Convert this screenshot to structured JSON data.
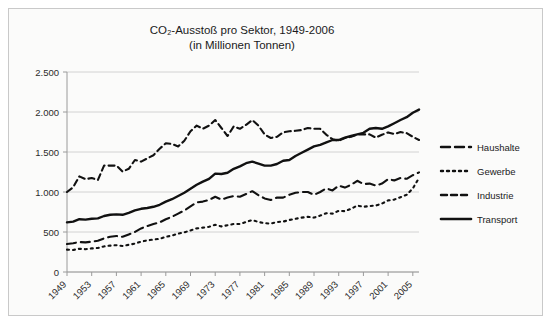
{
  "figure": {
    "title_line1": "CO₂-Ausstoß pro Sektor, 1949-2006",
    "title_line2": "(in Millionen Tonnen)",
    "background": "#fbfbfa",
    "border_color": "#c9c9c9",
    "ink_color": "#111111",
    "grid_color": "#d2d2d2"
  },
  "chart_data": {
    "type": "line",
    "title": "CO₂-Ausstoß pro Sektor, 1949-2006 (in Millionen Tonnen)",
    "subtitle": "(in Millionen Tonnen)",
    "xlabel": "",
    "ylabel": "",
    "ylim": [
      0,
      2500
    ],
    "yticks": [
      0,
      500,
      1000,
      1500,
      2000,
      2500
    ],
    "ytick_labels": [
      "0",
      "500",
      "1.000",
      "1.500",
      "2.000",
      "2.500"
    ],
    "grid": "horizontal",
    "legend_position": "right",
    "x_tick_labels": [
      "1949",
      "1953",
      "1957",
      "1961",
      "1965",
      "1969",
      "1973",
      "1977",
      "1981",
      "1985",
      "1989",
      "1993",
      "1997",
      "2001",
      "2005"
    ],
    "x_tick_rotation": 45,
    "x": [
      1949,
      1950,
      1951,
      1952,
      1953,
      1954,
      1955,
      1956,
      1957,
      1958,
      1959,
      1960,
      1961,
      1962,
      1963,
      1964,
      1965,
      1966,
      1967,
      1968,
      1969,
      1970,
      1971,
      1972,
      1973,
      1974,
      1975,
      1976,
      1977,
      1978,
      1979,
      1980,
      1981,
      1982,
      1983,
      1984,
      1985,
      1986,
      1987,
      1988,
      1989,
      1990,
      1991,
      1992,
      1993,
      1994,
      1995,
      1996,
      1997,
      1998,
      1999,
      2000,
      2001,
      2002,
      2003,
      2004,
      2005,
      2006
    ],
    "series": [
      {
        "name": "Haushalte",
        "style": "long-dash",
        "values": [
          350,
          360,
          375,
          370,
          380,
          390,
          420,
          440,
          450,
          440,
          470,
          500,
          545,
          575,
          600,
          620,
          660,
          690,
          730,
          770,
          820,
          870,
          880,
          900,
          940,
          905,
          930,
          950,
          940,
          975,
          1010,
          960,
          920,
          900,
          930,
          930,
          965,
          990,
          1000,
          1000,
          965,
          1000,
          1045,
          1020,
          1080,
          1055,
          1090,
          1140,
          1100,
          1105,
          1080,
          1105,
          1160,
          1145,
          1175,
          1165,
          1210,
          1245
        ],
        "line_dash": "9,5"
      },
      {
        "name": "Gewerbe",
        "style": "dotted",
        "values": [
          280,
          275,
          290,
          285,
          295,
          300,
          320,
          330,
          335,
          325,
          340,
          355,
          380,
          395,
          405,
          415,
          440,
          455,
          480,
          495,
          520,
          545,
          555,
          565,
          590,
          570,
          585,
          600,
          600,
          625,
          650,
          625,
          610,
          605,
          625,
          630,
          650,
          665,
          680,
          690,
          680,
          705,
          735,
          730,
          765,
          760,
          790,
          830,
          815,
          825,
          830,
          855,
          895,
          905,
          935,
          965,
          1045,
          1175
        ],
        "line_dash": "2,4"
      },
      {
        "name": "Industrie",
        "style": "dash",
        "values": [
          1000,
          1060,
          1195,
          1160,
          1175,
          1150,
          1330,
          1330,
          1330,
          1255,
          1290,
          1400,
          1380,
          1420,
          1460,
          1540,
          1610,
          1600,
          1570,
          1640,
          1760,
          1830,
          1790,
          1830,
          1900,
          1800,
          1700,
          1820,
          1790,
          1840,
          1900,
          1830,
          1720,
          1675,
          1690,
          1745,
          1760,
          1765,
          1775,
          1800,
          1790,
          1790,
          1715,
          1660,
          1640,
          1675,
          1690,
          1720,
          1720,
          1720,
          1680,
          1715,
          1745,
          1725,
          1750,
          1735,
          1690,
          1650
        ],
        "line_dash": "6,4"
      },
      {
        "name": "Transport",
        "style": "solid",
        "values": [
          620,
          630,
          660,
          655,
          665,
          670,
          700,
          715,
          720,
          715,
          740,
          770,
          790,
          800,
          815,
          840,
          880,
          910,
          950,
          990,
          1040,
          1090,
          1130,
          1165,
          1230,
          1225,
          1240,
          1290,
          1320,
          1360,
          1380,
          1355,
          1330,
          1330,
          1350,
          1390,
          1400,
          1450,
          1490,
          1530,
          1570,
          1590,
          1620,
          1650,
          1650,
          1680,
          1700,
          1720,
          1740,
          1790,
          1800,
          1790,
          1820,
          1860,
          1900,
          1935,
          1990,
          2030
        ],
        "line_dash": "none"
      }
    ]
  },
  "legend": {
    "items": [
      {
        "label": "Haushalte",
        "dash": "9,5"
      },
      {
        "label": "Gewerbe",
        "dash": "2,4"
      },
      {
        "label": "Industrie",
        "dash": "6,4"
      },
      {
        "label": "Transport",
        "dash": "none"
      }
    ]
  }
}
